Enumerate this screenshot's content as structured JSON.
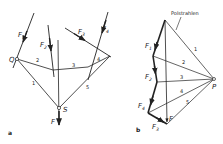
{
  "colors": {
    "line": "#222222",
    "background": "#ffffff"
  },
  "panel_a": {
    "caption": "a",
    "point_Q": "Q",
    "point_S": "S",
    "forces": [
      {
        "label": "F",
        "sub": "1"
      },
      {
        "label": "F",
        "sub": "2"
      },
      {
        "label": "F",
        "sub": "3"
      },
      {
        "label": "F",
        "sub": "4"
      }
    ],
    "resultant": "F",
    "rope_segments": [
      "1",
      "2",
      "3",
      "4",
      "5"
    ]
  },
  "panel_b": {
    "caption": "b",
    "pole": "P",
    "annotation": "Polstrahlen",
    "forces": [
      {
        "label": "F",
        "sub": "1"
      },
      {
        "label": "F",
        "sub": "2"
      },
      {
        "label": "F",
        "sub": "4"
      },
      {
        "label": "F",
        "sub": "3"
      }
    ],
    "resultant": "F",
    "pole_rays": [
      "1",
      "2",
      "3",
      "4",
      "5"
    ]
  }
}
